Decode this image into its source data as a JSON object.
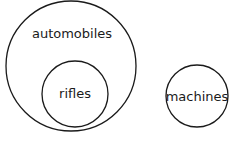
{
  "diagram": {
    "type": "venn",
    "circles": [
      {
        "id": "automobiles",
        "label": "automobiles",
        "cx": 71,
        "cy": 66,
        "r": 65,
        "label_x": 72,
        "label_y": 38
      },
      {
        "id": "rifles",
        "label": "rifles",
        "cx": 75,
        "cy": 94,
        "r": 33,
        "label_x": 75,
        "label_y": 98
      },
      {
        "id": "machines",
        "label": "machines",
        "cx": 197,
        "cy": 96,
        "r": 31,
        "label_x": 197,
        "label_y": 101
      }
    ],
    "stroke_color": "#1a1a1a",
    "background": "#ffffff"
  }
}
